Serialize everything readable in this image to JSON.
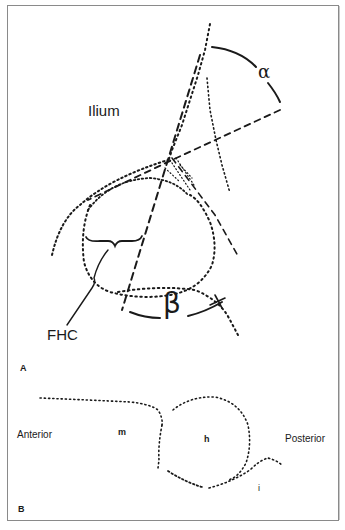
{
  "figure": {
    "panels": [
      {
        "id": "A",
        "label": "A",
        "structure_labels": {
          "ilium": "Ilium",
          "fhc": "FHC",
          "alpha": "α",
          "beta": "β"
        }
      },
      {
        "id": "B",
        "label": "B",
        "structure_labels": {
          "anterior": "Anterior",
          "m": "m",
          "h": "h",
          "posterior": "Posterior",
          "i": "i"
        }
      }
    ]
  },
  "colors": {
    "ink": "#1a1a1a",
    "frame": "#8a8a8a",
    "background": "#ffffff"
  }
}
